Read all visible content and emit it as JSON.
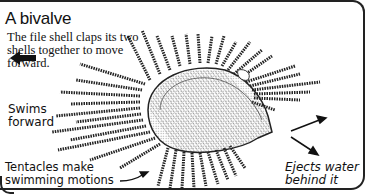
{
  "title": "A bivalve",
  "description": "The file shell claps its two shells together to move forward.",
  "labels": {
    "swims": "Swims forward",
    "swims_line1": "Swims",
    "swims_line2": "forward",
    "tentacles_line1": "Tentacles make",
    "tentacles_line2": "swimming motions",
    "ejects_line1": "Ejects water",
    "ejects_line2": "behind it"
  },
  "icons": {
    "direction_arrow": "left-arrow-icon",
    "water_arrows": "diverging-arrows-icon",
    "pointer_arrow": "curved-pointer-arrow-icon"
  },
  "colors": {
    "ink": "#111111",
    "background": "#ffffff"
  }
}
